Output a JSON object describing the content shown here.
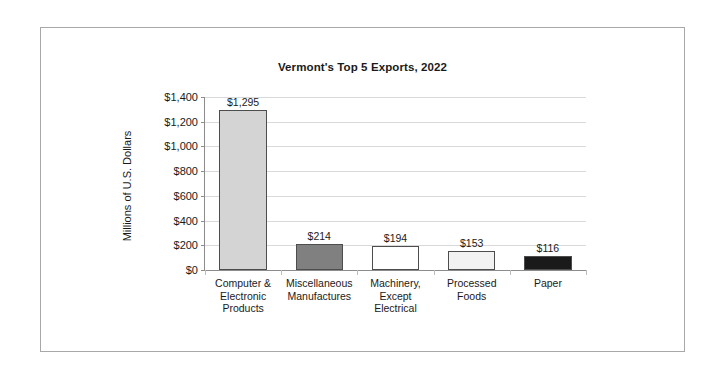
{
  "chart_data": {
    "type": "bar",
    "title": "Vermont's Top 5 Exports, 2022",
    "xlabel": "",
    "ylabel": "Millions of U.S. Dollars",
    "ylim": [
      0,
      1400
    ],
    "ytick_step": 200,
    "grid": true,
    "legend": "none",
    "categories": [
      "Computer & Electronic Products",
      "Miscellaneous Manufactures",
      "Machinery, Except Electrical",
      "Processed Foods",
      "Paper"
    ],
    "category_lines": [
      [
        "Computer &",
        "Electronic",
        "Products"
      ],
      [
        "Miscellaneous",
        "Manufactures"
      ],
      [
        "Machinery,",
        "Except",
        "Electrical"
      ],
      [
        "Processed",
        "Foods"
      ],
      [
        "Paper"
      ]
    ],
    "values": [
      1295,
      214,
      194,
      153,
      116
    ],
    "data_labels": [
      "$1,295",
      "$214",
      "$194",
      "$153",
      "$116"
    ],
    "ytick_labels": [
      "$1,400",
      "$1,200",
      "$1,000",
      "$800",
      "$600",
      "$400",
      "$200",
      "$0"
    ],
    "ytick_values": [
      1400,
      1200,
      1000,
      800,
      600,
      400,
      200,
      0
    ],
    "bar_colors": [
      "#d4d4d4",
      "#808080",
      "#ffffff",
      "#f2f2f2",
      "#1a1a1a"
    ],
    "bar_border_color": "#4d4d4d",
    "gridline_color": "#d9d9d9",
    "axis_color": "#8c8c8c",
    "frame_border_color": "#a8a8a8",
    "text_color": "#1a1a1a",
    "background_color": "#ffffff"
  }
}
